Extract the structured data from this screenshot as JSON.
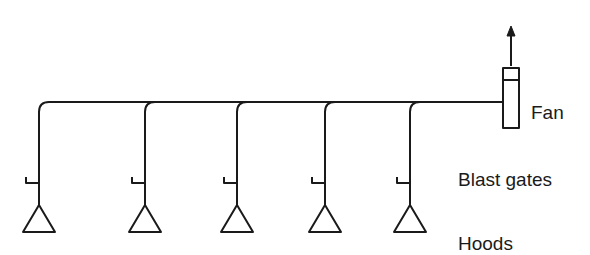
{
  "diagram": {
    "type": "local exhaust ventilation system",
    "labels": {
      "fan": "Fan",
      "blast_gates": "Blast gates",
      "hoods": "Hoods"
    },
    "colors": {
      "line": "#1a1a1a",
      "background": "#ffffff"
    },
    "main_duct": {
      "y": 102,
      "x_start": 38,
      "x_end": 503
    },
    "branches": [
      {
        "x": 39
      },
      {
        "x": 145
      },
      {
        "x": 237
      },
      {
        "x": 325
      },
      {
        "x": 410
      }
    ],
    "fan": {
      "x": 503,
      "y": 68,
      "width": 16,
      "height": 60,
      "divider_y": 80
    },
    "exhaust_arrow": {
      "x": 511,
      "y_start": 66,
      "y_end": 26
    }
  }
}
